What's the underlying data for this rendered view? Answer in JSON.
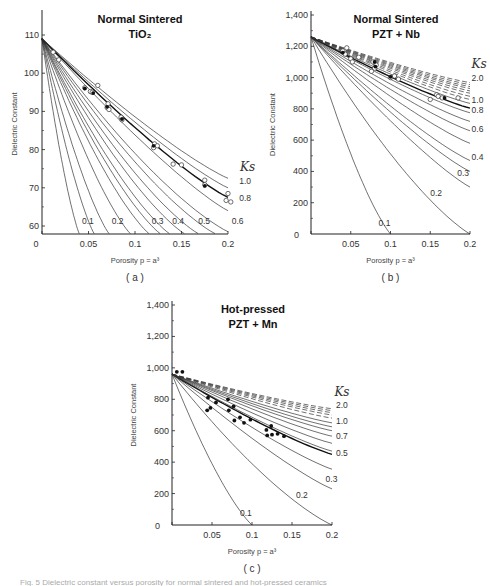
{
  "caption": "Fig. 5  Dielectric constant versus porosity for normal sintered and hot-pressed ceramics",
  "chart_data": [
    {
      "id": "a",
      "type": "line",
      "panel_label": "( a )",
      "title": [
        "Normal Sintered",
        "TiO₂"
      ],
      "xlabel": "Porosity  p = a³",
      "ylabel": "Dielectric Constant",
      "xlim": [
        0,
        0.2
      ],
      "ylim": [
        58,
        115
      ],
      "x_ticks": [
        0,
        0.05,
        0.1,
        0.15,
        0.2
      ],
      "x_tick_labels": [
        "0",
        "0.05",
        "0.1",
        "0.15",
        "0.2"
      ],
      "y_ticks": [
        60,
        70,
        80,
        90,
        100,
        110
      ],
      "y_tick_labels": [
        "60",
        "70",
        "80",
        "90",
        "100",
        "110"
      ],
      "origin_label": "0",
      "legend_title": "Ks",
      "eps0": 109,
      "frame": {
        "x0": 42,
        "x1": 228,
        "y_top": 14,
        "y_bottom": 234,
        "y_at_ymin": 234
      },
      "curves": [
        {
          "ks": 0.1,
          "end_p": 0.04,
          "end_v": 58,
          "label": "0.1",
          "label_pos": [
            0.043,
            60.5
          ],
          "dashed": false
        },
        {
          "ks": 0.15,
          "end_p": 0.056,
          "end_v": 58,
          "label": "",
          "dashed": false
        },
        {
          "ks": 0.2,
          "end_p": 0.072,
          "end_v": 58,
          "label": "0.2",
          "label_pos": [
            0.075,
            60.5
          ],
          "dashed": false
        },
        {
          "ks": 0.25,
          "end_p": 0.095,
          "end_v": 58,
          "label": "",
          "dashed": false
        },
        {
          "ks": 0.3,
          "end_p": 0.115,
          "end_v": 58,
          "label": "0.3",
          "label_pos": [
            0.118,
            60.5
          ],
          "dashed": false
        },
        {
          "ks": 0.35,
          "end_p": 0.127,
          "end_v": 58,
          "label": "",
          "dashed": false
        },
        {
          "ks": 0.4,
          "end_p": 0.137,
          "end_v": 58,
          "label": "0.4",
          "label_pos": [
            0.14,
            60.5
          ],
          "dashed": false
        },
        {
          "ks": 0.45,
          "end_p": 0.153,
          "end_v": 58,
          "label": "",
          "dashed": false
        },
        {
          "ks": 0.5,
          "end_p": 0.168,
          "end_v": 58,
          "label": "0.5",
          "label_pos": [
            0.168,
            60.5
          ],
          "dashed": false
        },
        {
          "ks": 0.55,
          "end_p": 0.186,
          "end_v": 58,
          "label": "",
          "dashed": false
        },
        {
          "ks": 0.6,
          "end_p": 0.2,
          "end_v": 58.5,
          "label": "0.6",
          "label_pos": [
            0.204,
            60.5
          ],
          "dashed": false
        },
        {
          "ks": 0.7,
          "end_p": 0.2,
          "end_v": 64,
          "label": "",
          "dashed": false
        },
        {
          "ks": 0.8,
          "end_p": 0.2,
          "end_v": 67.5,
          "label": "0.8",
          "label_pos": [
            0.212,
            66.5
          ],
          "dashed": false,
          "bold": true
        },
        {
          "ks": 0.9,
          "end_p": 0.2,
          "end_v": 70,
          "label": "",
          "dashed": false
        },
        {
          "ks": 1.0,
          "end_p": 0.2,
          "end_v": 72.5,
          "label": "1.0",
          "label_pos": [
            0.212,
            71
          ],
          "dashed": false
        }
      ],
      "ks_title_pos": [
        0.213,
        74.5
      ],
      "points_open": [
        [
          0.012,
          105.5
        ],
        [
          0.018,
          103.5
        ],
        [
          0.046,
          96.2
        ],
        [
          0.052,
          95.2
        ],
        [
          0.054,
          95.0
        ],
        [
          0.06,
          96.8
        ],
        [
          0.07,
          91.0
        ],
        [
          0.071,
          92.0
        ],
        [
          0.072,
          90.5
        ],
        [
          0.085,
          88.5
        ],
        [
          0.086,
          87.8
        ],
        [
          0.121,
          81.5
        ],
        [
          0.12,
          80.5
        ],
        [
          0.124,
          81.0
        ],
        [
          0.141,
          76.2
        ],
        [
          0.15,
          76.0
        ],
        [
          0.175,
          72.0
        ],
        [
          0.175,
          70.8
        ],
        [
          0.2,
          68.5
        ],
        [
          0.198,
          66.7
        ],
        [
          0.203,
          66.3
        ]
      ],
      "points_filled": [
        [
          0.046,
          96.0
        ],
        [
          0.055,
          94.8
        ],
        [
          0.07,
          91.2
        ],
        [
          0.086,
          88.0
        ],
        [
          0.12,
          81.0
        ],
        [
          0.175,
          70.5
        ]
      ]
    },
    {
      "id": "b",
      "type": "line",
      "panel_label": "( b )",
      "title": [
        "Normal Sintered",
        "PZT + Nb"
      ],
      "xlabel": "Porosity  p = a³",
      "ylabel": "Dielectric Constant",
      "xlim": [
        0,
        0.2
      ],
      "ylim": [
        0,
        1400
      ],
      "x_ticks": [
        0,
        0.05,
        0.1,
        0.15,
        0.2
      ],
      "x_tick_labels": [
        "0",
        "0.05",
        "0.1",
        "0.15",
        "0.2"
      ],
      "y_ticks": [
        0,
        200,
        400,
        600,
        800,
        1000,
        1200,
        1400
      ],
      "y_tick_labels": [
        "0",
        "200",
        "400",
        "600",
        "800",
        "1,000",
        "1,200",
        "1,400"
      ],
      "legend_title": "Ks",
      "eps0": 1260,
      "frame": {
        "x0": 311,
        "x1": 470,
        "y_top": 15,
        "y_bottom": 234
      },
      "curves": [
        {
          "ks": 0.1,
          "end_p": 0.1,
          "end_v": 0,
          "label": "0.1",
          "label_pos": [
            0.085,
            50
          ],
          "dashed": false
        },
        {
          "ks": 0.2,
          "end_p": 0.2,
          "end_v": 0,
          "label": "0.2",
          "label_pos": [
            0.15,
            240
          ],
          "dashed": false
        },
        {
          "ks": 0.3,
          "end_p": 0.2,
          "end_v": 300,
          "label": "0.3",
          "label_pos": [
            0.184,
            370
          ],
          "dashed": false
        },
        {
          "ks": 0.35,
          "end_p": 0.2,
          "end_v": 400,
          "label": "",
          "dashed": false
        },
        {
          "ks": 0.4,
          "end_p": 0.2,
          "end_v": 470,
          "label": "0.4",
          "label_pos": [
            0.202,
            470
          ],
          "dashed": false
        },
        {
          "ks": 0.5,
          "end_p": 0.2,
          "end_v": 580,
          "label": "",
          "dashed": false
        },
        {
          "ks": 0.6,
          "end_p": 0.2,
          "end_v": 660,
          "label": "0.6",
          "label_pos": [
            0.202,
            655
          ],
          "dashed": false
        },
        {
          "ks": 0.7,
          "end_p": 0.2,
          "end_v": 720,
          "label": "",
          "dashed": false
        },
        {
          "ks": 0.8,
          "end_p": 0.2,
          "end_v": 775,
          "label": "0.8",
          "label_pos": [
            0.202,
            775
          ],
          "dashed": false
        },
        {
          "ks": 0.9,
          "end_p": 0.2,
          "end_v": 805,
          "label": "",
          "dashed": false,
          "bold": true
        },
        {
          "ks": 1.0,
          "end_p": 0.2,
          "end_v": 835,
          "label": "1.0",
          "label_pos": [
            0.202,
            840
          ],
          "dashed": false
        },
        {
          "ks": 1.1,
          "end_p": 0.2,
          "end_v": 860,
          "label": "",
          "dashed": true
        },
        {
          "ks": 1.2,
          "end_p": 0.2,
          "end_v": 880,
          "label": "",
          "dashed": true
        },
        {
          "ks": 1.3,
          "end_p": 0.2,
          "end_v": 900,
          "label": "",
          "dashed": true
        },
        {
          "ks": 1.4,
          "end_p": 0.2,
          "end_v": 915,
          "label": "",
          "dashed": true
        },
        {
          "ks": 1.5,
          "end_p": 0.2,
          "end_v": 930,
          "label": "",
          "dashed": true
        },
        {
          "ks": 1.6,
          "end_p": 0.2,
          "end_v": 942,
          "label": "",
          "dashed": true
        },
        {
          "ks": 1.8,
          "end_p": 0.2,
          "end_v": 955,
          "label": "",
          "dashed": true
        },
        {
          "ks": 2.0,
          "end_p": 0.2,
          "end_v": 968,
          "label": "2.0",
          "label_pos": [
            0.202,
            975
          ],
          "dashed": true
        }
      ],
      "ks_title_pos": [
        0.202,
        1060
      ],
      "points_open": [
        [
          0.04,
          1170
        ],
        [
          0.045,
          1190
        ],
        [
          0.043,
          1150
        ],
        [
          0.05,
          1120
        ],
        [
          0.052,
          1100
        ],
        [
          0.06,
          1130
        ],
        [
          0.078,
          1100
        ],
        [
          0.08,
          1060
        ],
        [
          0.082,
          1080
        ],
        [
          0.076,
          1040
        ],
        [
          0.1,
          1000
        ],
        [
          0.105,
          1010
        ],
        [
          0.11,
          990
        ],
        [
          0.15,
          860
        ],
        [
          0.158,
          890
        ],
        [
          0.16,
          880
        ],
        [
          0.165,
          870
        ],
        [
          0.185,
          870
        ]
      ],
      "points_filled": [
        [
          0.04,
          1160
        ],
        [
          0.08,
          1100
        ],
        [
          0.081,
          1070
        ],
        [
          0.1,
          1005
        ],
        [
          0.168,
          870
        ]
      ]
    },
    {
      "id": "c",
      "type": "line",
      "panel_label": "( c )",
      "title": [
        "Hot-pressed",
        "PZT + Mn"
      ],
      "xlabel": "Porosity  p = a³",
      "ylabel": "Dielectric Constant",
      "xlim": [
        0,
        0.2
      ],
      "ylim": [
        0,
        1400
      ],
      "x_ticks": [
        0,
        0.05,
        0.1,
        0.15,
        0.2
      ],
      "x_tick_labels": [
        "0",
        "0.05",
        "0.1",
        "0.15",
        "0.2"
      ],
      "y_ticks": [
        0,
        200,
        400,
        600,
        800,
        1000,
        1200,
        1400
      ],
      "y_tick_labels": [
        "0",
        "200",
        "400",
        "600",
        "800",
        "1,000",
        "1,200",
        "1,400"
      ],
      "legend_title": "Ks",
      "eps0": 960,
      "frame": {
        "x0": 172,
        "x1": 332,
        "y_top": 305,
        "y_bottom": 525
      },
      "curves": [
        {
          "ks": 0.1,
          "end_p": 0.1,
          "end_v": 0,
          "label": "0.1",
          "label_pos": [
            0.085,
            60
          ],
          "dashed": false
        },
        {
          "ks": 0.2,
          "end_p": 0.2,
          "end_v": 0,
          "label": "0.2",
          "label_pos": [
            0.155,
            170
          ],
          "dashed": false
        },
        {
          "ks": 0.3,
          "end_p": 0.2,
          "end_v": 230,
          "label": "0.3",
          "label_pos": [
            0.192,
            275
          ],
          "dashed": false
        },
        {
          "ks": 0.4,
          "end_p": 0.2,
          "end_v": 355,
          "label": "",
          "dashed": false
        },
        {
          "ks": 0.5,
          "end_p": 0.2,
          "end_v": 450,
          "label": "0.5",
          "label_pos": [
            0.205,
            440
          ],
          "dashed": false,
          "bold": true
        },
        {
          "ks": 0.55,
          "end_p": 0.2,
          "end_v": 470,
          "label": "",
          "dashed": false
        },
        {
          "ks": 0.6,
          "end_p": 0.2,
          "end_v": 520,
          "label": "",
          "dashed": false
        },
        {
          "ks": 0.7,
          "end_p": 0.2,
          "end_v": 565,
          "label": "0.7",
          "label_pos": [
            0.205,
            545
          ],
          "dashed": false
        },
        {
          "ks": 0.8,
          "end_p": 0.2,
          "end_v": 600,
          "label": "",
          "dashed": false
        },
        {
          "ks": 0.9,
          "end_p": 0.2,
          "end_v": 625,
          "label": "",
          "dashed": false
        },
        {
          "ks": 1.0,
          "end_p": 0.2,
          "end_v": 650,
          "label": "1.0",
          "label_pos": [
            0.205,
            645
          ],
          "dashed": false
        },
        {
          "ks": 1.2,
          "end_p": 0.2,
          "end_v": 680,
          "label": "",
          "dashed": true
        },
        {
          "ks": 1.4,
          "end_p": 0.2,
          "end_v": 700,
          "label": "",
          "dashed": true
        },
        {
          "ks": 1.6,
          "end_p": 0.2,
          "end_v": 715,
          "label": "",
          "dashed": true
        },
        {
          "ks": 1.8,
          "end_p": 0.2,
          "end_v": 728,
          "label": "",
          "dashed": true
        },
        {
          "ks": 2.0,
          "end_p": 0.2,
          "end_v": 740,
          "label": "2.0",
          "label_pos": [
            0.205,
            745
          ],
          "dashed": true
        }
      ],
      "ks_title_pos": [
        0.203,
        820
      ],
      "points_open": [],
      "points_filled": [
        [
          0.006,
          975
        ],
        [
          0.013,
          975
        ],
        [
          0.044,
          730
        ],
        [
          0.048,
          745
        ],
        [
          0.045,
          810
        ],
        [
          0.055,
          780
        ],
        [
          0.07,
          800
        ],
        [
          0.071,
          730
        ],
        [
          0.077,
          755
        ],
        [
          0.078,
          665
        ],
        [
          0.085,
          685
        ],
        [
          0.09,
          650
        ],
        [
          0.098,
          670
        ],
        [
          0.118,
          605
        ],
        [
          0.119,
          570
        ],
        [
          0.124,
          630
        ],
        [
          0.125,
          575
        ],
        [
          0.132,
          580
        ],
        [
          0.14,
          565
        ]
      ]
    }
  ]
}
